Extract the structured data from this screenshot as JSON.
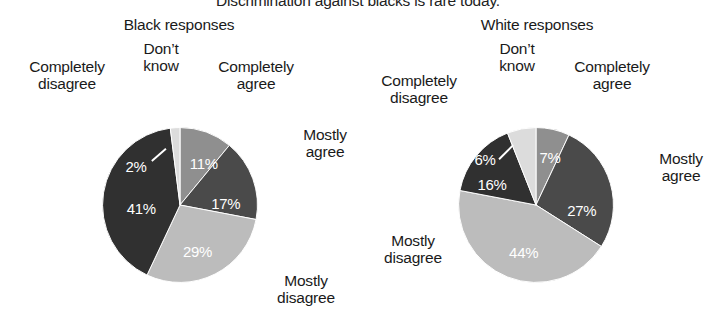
{
  "chart_title": "Discrimination against blacks is rare today.",
  "panels": [
    {
      "title": "Black responses",
      "labels": {
        "completely_agree": "Completely\nagree",
        "completely_agree_l1": "Completely",
        "completely_agree_l2": "agree",
        "mostly_agree_l1": "Mostly",
        "mostly_agree_l2": "agree",
        "mostly_disagree_l1": "Mostly",
        "mostly_disagree_l2": "disagree",
        "completely_disagree_l1": "Completely",
        "completely_disagree_l2": "disagree",
        "dont_know_l1": "Don’t",
        "dont_know_l2": "know"
      },
      "values": {
        "completely_agree": "11%",
        "mostly_agree": "17%",
        "mostly_disagree": "29%",
        "completely_disagree": "41%",
        "dont_know": "2%"
      }
    },
    {
      "title": "White responses",
      "labels": {
        "completely_agree_l1": "Completely",
        "completely_agree_l2": "agree",
        "mostly_agree_l1": "Mostly",
        "mostly_agree_l2": "agree",
        "mostly_disagree_l1": "Mostly",
        "mostly_disagree_l2": "disagree",
        "completely_disagree_l1": "Completely",
        "completely_disagree_l2": "disagree",
        "dont_know_l1": "Don’t",
        "dont_know_l2": "know"
      },
      "values": {
        "completely_agree": "7%",
        "mostly_agree": "27%",
        "mostly_disagree": "44%",
        "completely_disagree": "16%",
        "dont_know": "6%"
      }
    }
  ],
  "colors": {
    "completely_agree": "#8f8f8f",
    "mostly_agree": "#4a4a4a",
    "mostly_disagree": "#bcbcbc",
    "completely_disagree": "#303030",
    "dont_know": "#dcdcdc",
    "background": "#ffffff",
    "text": "#1a1a1a",
    "value_text": "#ffffff"
  },
  "chart_data": {
    "type": "pie",
    "title": "Discrimination against blacks is rare today.",
    "categories": [
      "Completely agree",
      "Mostly agree",
      "Mostly disagree",
      "Completely disagree",
      "Don’t know"
    ],
    "slice_colors": [
      "#8f8f8f",
      "#4a4a4a",
      "#bcbcbc",
      "#303030",
      "#dcdcdc"
    ],
    "start_angle_deg": 0,
    "direction": "clockwise",
    "units": "percent",
    "legend": "none (direct slice labels)",
    "grid": false,
    "series": [
      {
        "name": "Black responses",
        "values": [
          11,
          17,
          29,
          41,
          2
        ]
      },
      {
        "name": "White responses",
        "values": [
          7,
          27,
          44,
          16,
          6
        ]
      }
    ]
  }
}
